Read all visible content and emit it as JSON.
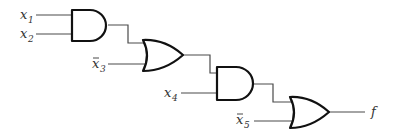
{
  "diagram": {
    "type": "logic-circuit",
    "inputs": [
      {
        "id": "x1",
        "base": "x",
        "sub": "1",
        "negated": false
      },
      {
        "id": "x2",
        "base": "x",
        "sub": "2",
        "negated": false
      },
      {
        "id": "x3",
        "base": "x",
        "sub": "3",
        "negated": true
      },
      {
        "id": "x4",
        "base": "x",
        "sub": "4",
        "negated": false
      },
      {
        "id": "x5",
        "base": "x",
        "sub": "5",
        "negated": true
      }
    ],
    "gates": [
      {
        "id": "g1",
        "type": "AND",
        "inputs": [
          "x1",
          "x2"
        ]
      },
      {
        "id": "g2",
        "type": "OR",
        "inputs": [
          "g1",
          "x3'"
        ]
      },
      {
        "id": "g3",
        "type": "AND",
        "inputs": [
          "g2",
          "x4"
        ]
      },
      {
        "id": "g4",
        "type": "OR",
        "inputs": [
          "g3",
          "x5'"
        ]
      }
    ],
    "output": {
      "label": "f",
      "source": "g4"
    }
  }
}
